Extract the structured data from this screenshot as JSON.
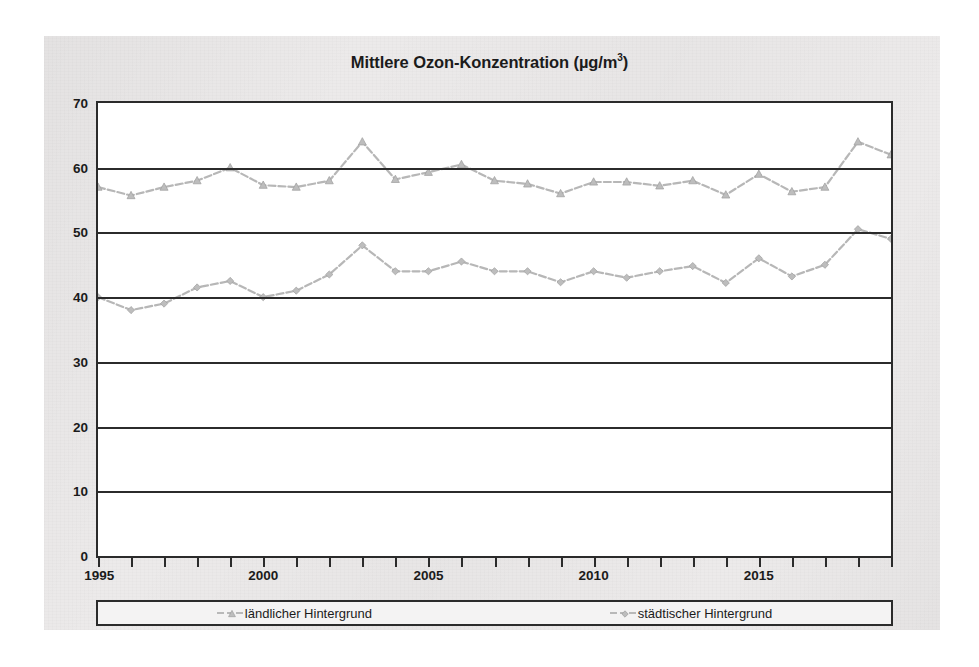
{
  "chart_data": {
    "type": "line",
    "title_main": "Mittlere Ozon-Konzentration (µg/m",
    "title_sup": "3",
    "title_tail": ")",
    "xlabel": "",
    "ylabel": "",
    "x": [
      1995,
      1996,
      1997,
      1998,
      1999,
      2000,
      2001,
      2002,
      2003,
      2004,
      2005,
      2006,
      2007,
      2008,
      2009,
      2010,
      2011,
      2012,
      2013,
      2014,
      2015,
      2016,
      2017,
      2018,
      2019
    ],
    "xlim": [
      1995,
      2019
    ],
    "ylim": [
      0,
      70
    ],
    "ytick_labels": [
      "70",
      "60",
      "50",
      "40",
      "30",
      "20",
      "10",
      "0"
    ],
    "yticks": [
      70,
      60,
      50,
      40,
      30,
      20,
      10,
      0
    ],
    "xtick_labels": [
      "1995",
      "2000",
      "2005",
      "2010",
      "2015"
    ],
    "xticks_major": [
      1995,
      2000,
      2005,
      2010,
      2015
    ],
    "grid": "horizontal",
    "legend_position": "bottom",
    "series": [
      {
        "name": "ländlicher Hintergrund",
        "marker": "triangle",
        "color": "#bdbdbd",
        "values": [
          57.0,
          55.7,
          57.0,
          58.0,
          60.0,
          57.3,
          57.0,
          58.0,
          64.0,
          58.2,
          59.3,
          60.5,
          58.0,
          57.5,
          56.0,
          57.8,
          57.8,
          57.2,
          58.0,
          55.8,
          59.0,
          56.3,
          57.0,
          64.0,
          62.0
        ]
      },
      {
        "name": "städtischer Hintergrund",
        "marker": "diamond",
        "color": "#bdbdbd",
        "values": [
          40.0,
          38.0,
          39.0,
          41.5,
          42.5,
          40.0,
          41.0,
          43.5,
          48.0,
          44.0,
          44.0,
          45.5,
          44.0,
          44.0,
          42.3,
          44.0,
          43.0,
          44.0,
          44.8,
          42.2,
          46.0,
          43.2,
          45.0,
          50.5,
          49.0
        ]
      }
    ]
  },
  "legend": {
    "entries": [
      {
        "label": "ländlicher Hintergrund",
        "marker": "triangle-marker-icon"
      },
      {
        "label": "städtischer Hintergrund",
        "marker": "diamond-marker-icon"
      }
    ]
  },
  "colors": {
    "axis": "#2b2b2b",
    "series": "#b7b7b7",
    "paper": "#eceaea",
    "plot_background": "#ffffff",
    "text": "#1b1b1b"
  }
}
